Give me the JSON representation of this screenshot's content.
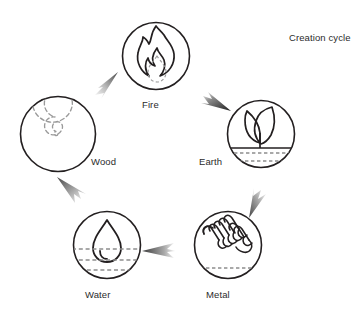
{
  "title": "Creation cycle",
  "colors": {
    "stroke": "#231f20",
    "dashed": "#8d8d8d",
    "arrow_dark": "#2b2b2b",
    "arrow_light": "#9a9a9a",
    "text": "#2b2b2b",
    "background": "#ffffff"
  },
  "diagram": {
    "name": "five-element-creation-cycle",
    "direction": "clockwise",
    "nodes": [
      {
        "id": "fire",
        "label": "Fire",
        "icon": "flame-icon",
        "cx": 156,
        "cy": 56,
        "r": 34
      },
      {
        "id": "earth",
        "label": "Earth",
        "icon": "sprout-icon",
        "cx": 261,
        "cy": 134,
        "r": 34
      },
      {
        "id": "metal",
        "label": "Metal",
        "icon": "spring-coil-icon",
        "cx": 228,
        "cy": 245,
        "r": 34
      },
      {
        "id": "water",
        "label": "Water",
        "icon": "water-drop-icon",
        "cx": 107,
        "cy": 245,
        "r": 34
      },
      {
        "id": "wood",
        "label": "Wood",
        "icon": "tree-rings-spiral-icon",
        "cx": 58,
        "cy": 134,
        "r": 38
      }
    ],
    "arrows": [
      {
        "id": "wood-to-fire",
        "from": "Wood",
        "to": "Fire",
        "shade": "light"
      },
      {
        "id": "fire-to-earth",
        "from": "Fire",
        "to": "Earth",
        "shade": "dark"
      },
      {
        "id": "earth-to-metal",
        "from": "Earth",
        "to": "Metal",
        "shade": "light"
      },
      {
        "id": "metal-to-water",
        "from": "Metal",
        "to": "Water",
        "shade": "dark"
      },
      {
        "id": "water-to-wood",
        "from": "Water",
        "to": "Wood",
        "shade": "light"
      }
    ]
  }
}
